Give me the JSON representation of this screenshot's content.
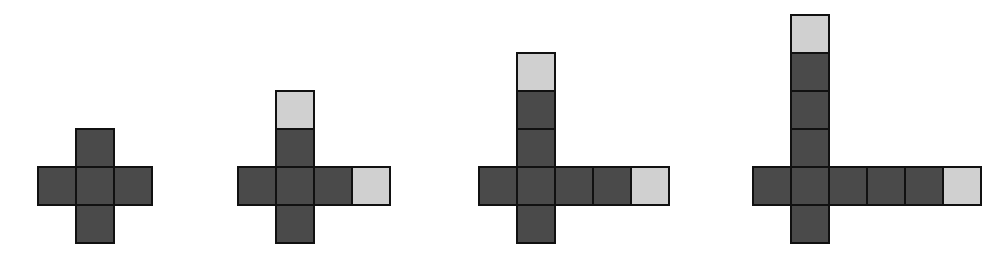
{
  "diagram": {
    "colors": {
      "dark_tile": "#4a4a4a",
      "light_tile": "#d0d0d0",
      "border": "#111111",
      "background": "#ffffff"
    },
    "tile_size": 38,
    "figures": [
      {
        "index": 1,
        "origin": {
          "x": 37,
          "y": 166
        },
        "center_col": 1,
        "tiles": [
          {
            "col": 1,
            "row": -1,
            "shade": "dark"
          },
          {
            "col": 0,
            "row": 0,
            "shade": "dark"
          },
          {
            "col": 1,
            "row": 0,
            "shade": "dark"
          },
          {
            "col": 2,
            "row": 0,
            "shade": "dark"
          },
          {
            "col": 1,
            "row": 1,
            "shade": "dark"
          }
        ]
      },
      {
        "index": 2,
        "origin": {
          "x": 237,
          "y": 166
        },
        "center_col": 1,
        "tiles": [
          {
            "col": 1,
            "row": -2,
            "shade": "light"
          },
          {
            "col": 1,
            "row": -1,
            "shade": "dark"
          },
          {
            "col": 0,
            "row": 0,
            "shade": "dark"
          },
          {
            "col": 1,
            "row": 0,
            "shade": "dark"
          },
          {
            "col": 2,
            "row": 0,
            "shade": "dark"
          },
          {
            "col": 3,
            "row": 0,
            "shade": "light"
          },
          {
            "col": 1,
            "row": 1,
            "shade": "dark"
          }
        ]
      },
      {
        "index": 3,
        "origin": {
          "x": 478,
          "y": 166
        },
        "center_col": 1,
        "tiles": [
          {
            "col": 1,
            "row": -3,
            "shade": "light"
          },
          {
            "col": 1,
            "row": -2,
            "shade": "dark"
          },
          {
            "col": 1,
            "row": -1,
            "shade": "dark"
          },
          {
            "col": 0,
            "row": 0,
            "shade": "dark"
          },
          {
            "col": 1,
            "row": 0,
            "shade": "dark"
          },
          {
            "col": 2,
            "row": 0,
            "shade": "dark"
          },
          {
            "col": 3,
            "row": 0,
            "shade": "dark"
          },
          {
            "col": 4,
            "row": 0,
            "shade": "light"
          },
          {
            "col": 1,
            "row": 1,
            "shade": "dark"
          }
        ]
      },
      {
        "index": 4,
        "origin": {
          "x": 752,
          "y": 166
        },
        "center_col": 1,
        "tiles": [
          {
            "col": 1,
            "row": -4,
            "shade": "light"
          },
          {
            "col": 1,
            "row": -3,
            "shade": "dark"
          },
          {
            "col": 1,
            "row": -2,
            "shade": "dark"
          },
          {
            "col": 1,
            "row": -1,
            "shade": "dark"
          },
          {
            "col": 0,
            "row": 0,
            "shade": "dark"
          },
          {
            "col": 1,
            "row": 0,
            "shade": "dark"
          },
          {
            "col": 2,
            "row": 0,
            "shade": "dark"
          },
          {
            "col": 3,
            "row": 0,
            "shade": "dark"
          },
          {
            "col": 4,
            "row": 0,
            "shade": "dark"
          },
          {
            "col": 5,
            "row": 0,
            "shade": "light"
          },
          {
            "col": 1,
            "row": 1,
            "shade": "dark"
          }
        ]
      }
    ]
  }
}
